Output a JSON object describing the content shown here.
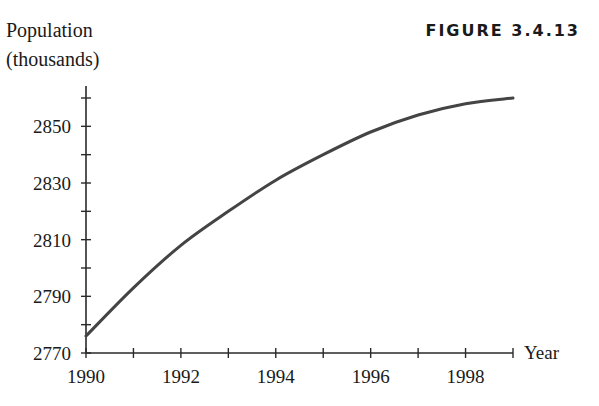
{
  "figure": {
    "label": "FIGURE 3.4.13"
  },
  "chart_data": {
    "type": "line",
    "title": "",
    "xlabel": "Year",
    "ylabel": "Population (thousands)",
    "ylabel_lines": [
      "Population",
      "(thousands)"
    ],
    "x": [
      1990,
      1991,
      1992,
      1993,
      1994,
      1995,
      1996,
      1997,
      1998,
      1999
    ],
    "series": [
      {
        "name": "Population",
        "values": [
          2776,
          2793,
          2808,
          2820,
          2831,
          2840,
          2848,
          2854,
          2858,
          2860
        ]
      }
    ],
    "xlim": [
      1990,
      1999
    ],
    "ylim": [
      2770,
      2860
    ],
    "x_ticks": [
      1990,
      1991,
      1992,
      1993,
      1994,
      1995,
      1996,
      1997,
      1998,
      1999
    ],
    "x_tick_labels": [
      "1990",
      "1992",
      "1994",
      "1996",
      "1998"
    ],
    "x_tick_label_values": [
      1990,
      1992,
      1994,
      1996,
      1998
    ],
    "y_ticks": [
      2770,
      2780,
      2790,
      2800,
      2810,
      2820,
      2830,
      2840,
      2850,
      2860
    ],
    "y_tick_labels": [
      "2770",
      "2790",
      "2810",
      "2830",
      "2850"
    ],
    "y_tick_label_values": [
      2770,
      2790,
      2810,
      2830,
      2850
    ],
    "grid": false,
    "legend": "none",
    "line_color": "#444444"
  }
}
